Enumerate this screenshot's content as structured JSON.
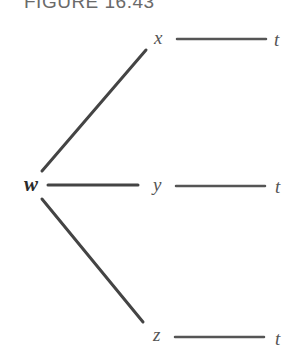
{
  "figure": {
    "title": "FIGURE 16.43"
  },
  "nodes": {
    "w": "w",
    "x": "x",
    "y": "y",
    "z": "z",
    "t_top": "t",
    "t_mid": "t",
    "t_bottom": "t"
  },
  "colors": {
    "line": "#444444",
    "label": "#555555",
    "title": "#6a6a6a"
  },
  "edges": [
    {
      "from": "w",
      "to": "x"
    },
    {
      "from": "w",
      "to": "y"
    },
    {
      "from": "w",
      "to": "z"
    },
    {
      "from": "x",
      "to": "t"
    },
    {
      "from": "y",
      "to": "t"
    },
    {
      "from": "z",
      "to": "t"
    }
  ]
}
